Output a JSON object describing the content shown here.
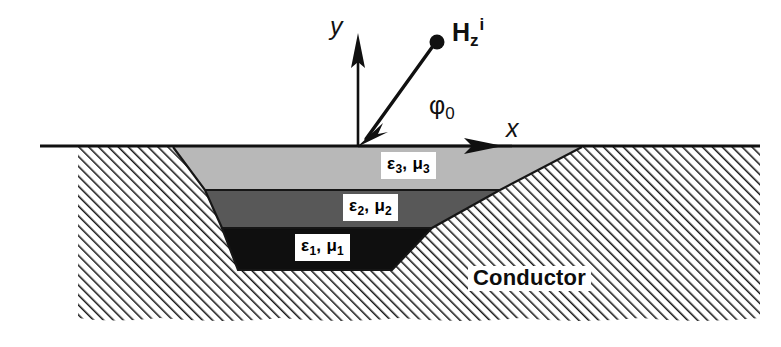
{
  "figure": {
    "type": "cross-section-diagram",
    "width": 781,
    "height": 347,
    "background_color": "#ffffff"
  },
  "axes": {
    "origin": {
      "x": 358,
      "y": 146
    },
    "y_axis": {
      "label": "y",
      "label_x": 332,
      "label_y": 28,
      "tip_x": 358,
      "tip_y": 35
    },
    "x_axis": {
      "label": "x",
      "label_x": 512,
      "label_y": 118,
      "tip_x": 500,
      "tip_y": 146
    },
    "color": "#101010"
  },
  "incident_wave": {
    "label_main": "H",
    "label_sub": "z",
    "label_sup": "i",
    "label_x": 455,
    "label_y": 22,
    "source_dot": {
      "x": 437,
      "y": 42,
      "r": 7
    },
    "ray_end": {
      "x": 358,
      "y": 146
    },
    "angle_label_main": "φ",
    "angle_label_sub": "0",
    "angle_label_x": 432,
    "angle_label_y": 100,
    "color": "#101010"
  },
  "surface": {
    "y": 146,
    "x_start": 40,
    "x_end": 760,
    "color": "#101010"
  },
  "conductor": {
    "label": "Conductor",
    "label_x": 470,
    "label_y": 268,
    "hatch_color": "#1a1a1a",
    "hatch_angle_deg": 45,
    "hatch_spacing_px": 7,
    "top_y": 146,
    "bottom_y": 322
  },
  "layers": [
    {
      "id": "layer-3",
      "label_eps": "ε",
      "label_eps_sub": "3",
      "label_mu": "μ",
      "label_mu_sub": "3",
      "fill_color": "#b8b8b8",
      "top_y": 147,
      "bottom_y": 190,
      "top_left_x": 173,
      "top_right_x": 582,
      "bottom_left_x": 205,
      "bottom_right_x": 500,
      "label_x": 383,
      "label_y": 155
    },
    {
      "id": "layer-2",
      "label_eps": "ε",
      "label_eps_sub": "2",
      "label_mu": "μ",
      "label_mu_sub": "2",
      "fill_color": "#585858",
      "top_y": 190,
      "bottom_y": 228,
      "top_left_x": 205,
      "top_right_x": 500,
      "bottom_left_x": 222,
      "bottom_right_x": 432,
      "label_x": 345,
      "label_y": 198
    },
    {
      "id": "layer-1",
      "label_eps": "ε",
      "label_eps_sub": "1",
      "label_mu": "μ",
      "label_mu_sub": "1",
      "fill_color": "#0f0f0f",
      "top_y": 228,
      "bottom_y": 270,
      "top_left_x": 222,
      "top_right_x": 432,
      "bottom_left_x": 238,
      "bottom_right_x": 392,
      "label_x": 297,
      "label_y": 238
    }
  ]
}
